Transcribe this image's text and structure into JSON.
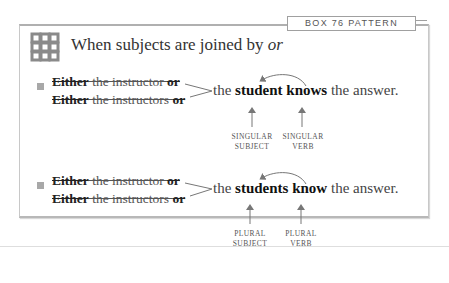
{
  "box": {
    "label": "BOX 76   PATTERN",
    "title_prefix": "When subjects are joined by ",
    "title_emphasis": "or",
    "icon": "knot-pattern-icon"
  },
  "examples": [
    {
      "line1": {
        "either": "Either",
        "middle": " the instructor ",
        "or": "or"
      },
      "line2": {
        "either": "Either",
        "middle": " the instructors ",
        "or": "or"
      },
      "sentence": {
        "pre": "the ",
        "subject": "student",
        "space": " ",
        "verb": "knows",
        "post": " the answer."
      },
      "captions": {
        "subject": [
          "SINGULAR",
          "SUBJECT"
        ],
        "verb": [
          "SINGULAR",
          "VERB"
        ]
      }
    },
    {
      "line1": {
        "either": "Either",
        "middle": " the instructor ",
        "or": "or"
      },
      "line2": {
        "either": "Either",
        "middle": " the instructors ",
        "or": "or"
      },
      "sentence": {
        "pre": "the ",
        "subject": "students",
        "space": " ",
        "verb": "know",
        "post": " the answer."
      },
      "captions": {
        "subject": [
          "PLURAL",
          "SUBJECT"
        ],
        "verb": [
          "PLURAL",
          "VERB"
        ]
      }
    }
  ]
}
